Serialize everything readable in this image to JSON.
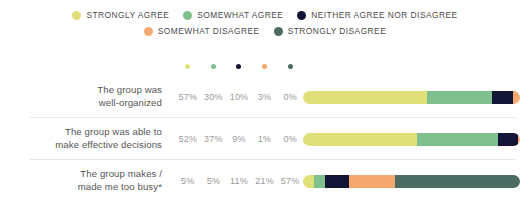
{
  "chart_data": {
    "type": "bar",
    "subtype": "stacked-horizontal-100pct",
    "title": "",
    "xlabel": "",
    "ylabel": "",
    "xlim": [
      0,
      100
    ],
    "grid": false,
    "legend_position": "top-center",
    "categories": [
      "The group was well-organized",
      "The group was able to make effective decisions",
      "The group makes / made me too busy*"
    ],
    "series": [
      {
        "name": "STRONGLY AGREE",
        "color": "#dfe07a",
        "values": [
          57,
          52,
          5
        ]
      },
      {
        "name": "SOMEWHAT AGREE",
        "color": "#80bf8e",
        "values": [
          30,
          37,
          5
        ]
      },
      {
        "name": "NEITHER AGREE NOR DISAGREE",
        "color": "#141436",
        "values": [
          10,
          9,
          11
        ]
      },
      {
        "name": "SOMEWHAT DISAGREE",
        "color": "#f5a96e",
        "values": [
          3,
          1,
          21
        ]
      },
      {
        "name": "STRONGLY DISAGREE",
        "color": "#4c6b63",
        "values": [
          0,
          0,
          57
        ]
      }
    ]
  },
  "legend": {
    "rows": [
      [
        {
          "label": "STRONGLY AGREE",
          "color": "#dfe07a",
          "icon": "legend-dot-icon"
        },
        {
          "label": "SOMEWHAT AGREE",
          "color": "#80bf8e",
          "icon": "legend-dot-icon"
        },
        {
          "label": "NEITHER AGREE NOR DISAGREE",
          "color": "#141436",
          "icon": "legend-dot-icon"
        }
      ],
      [
        {
          "label": "SOMEWHAT DISAGREE",
          "color": "#f5a96e",
          "icon": "legend-dot-icon"
        },
        {
          "label": "STRONGLY DISAGREE",
          "color": "#4c6b63",
          "icon": "legend-dot-icon"
        }
      ]
    ]
  },
  "column_dots": [
    {
      "color": "#dfe07a",
      "icon": "column-dot-icon"
    },
    {
      "color": "#80bf8e",
      "icon": "column-dot-icon"
    },
    {
      "color": "#141436",
      "icon": "column-dot-icon"
    },
    {
      "color": "#f5a96e",
      "icon": "column-dot-icon"
    },
    {
      "color": "#4c6b63",
      "icon": "column-dot-icon"
    }
  ],
  "rows": [
    {
      "label_line1": "The group was",
      "label_line2": "well-organized",
      "percents": [
        "57%",
        "30%",
        "10%",
        "3%",
        "0%"
      ],
      "segments": [
        {
          "value": 57,
          "color": "#dfe07a"
        },
        {
          "value": 30,
          "color": "#80bf8e"
        },
        {
          "value": 10,
          "color": "#141436"
        },
        {
          "value": 3,
          "color": "#f5a96e"
        },
        {
          "value": 0,
          "color": "#4c6b63"
        }
      ]
    },
    {
      "label_line1": "The group was able to",
      "label_line2": "make effective decisions",
      "percents": [
        "52%",
        "37%",
        "9%",
        "1%",
        "0%"
      ],
      "segments": [
        {
          "value": 52,
          "color": "#dfe07a"
        },
        {
          "value": 37,
          "color": "#80bf8e"
        },
        {
          "value": 9,
          "color": "#141436"
        },
        {
          "value": 1,
          "color": "#f5a96e"
        },
        {
          "value": 0,
          "color": "#4c6b63"
        }
      ]
    },
    {
      "label_line1": "The group makes /",
      "label_line2": "made me too busy*",
      "percents": [
        "5%",
        "5%",
        "11%",
        "21%",
        "57%"
      ],
      "segments": [
        {
          "value": 5,
          "color": "#dfe07a"
        },
        {
          "value": 5,
          "color": "#80bf8e"
        },
        {
          "value": 11,
          "color": "#141436"
        },
        {
          "value": 21,
          "color": "#f5a96e"
        },
        {
          "value": 57,
          "color": "#4c6b63"
        }
      ]
    }
  ]
}
